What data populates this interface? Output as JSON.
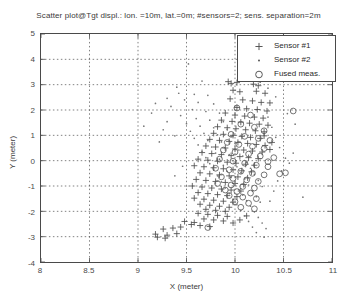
{
  "chart_data": {
    "type": "scatter",
    "title": "Scatter plot@Tgt displ.: lon. =10m, lat.=0m; #sensors=2; sens. separation=2m",
    "xlabel": "X (meter)",
    "ylabel": "Y (meter)",
    "xlim": [
      8,
      11
    ],
    "ylim": [
      -4,
      5
    ],
    "xticks": [
      8,
      8.5,
      9,
      9.5,
      10,
      10.5,
      11
    ],
    "xticklabels": [
      "8",
      "8.5",
      "9",
      "9.5",
      "10",
      "10.5",
      "11"
    ],
    "yticks": [
      -4,
      -3,
      -2,
      -1,
      0,
      1,
      2,
      3,
      4,
      5
    ],
    "yticklabels": [
      "-4",
      "-3",
      "-2",
      "-1",
      "0",
      "1",
      "2",
      "3",
      "4",
      "5"
    ],
    "grid": true,
    "grid_style": "dotted",
    "legend_position": "top-right",
    "marker_color": "#555555",
    "axis_color": "#4a4a4a",
    "background": "#ffffff",
    "series": [
      {
        "name": "Sensor #1",
        "marker": "plus",
        "color": "#4d4d4d",
        "points": [
          [
            9.93,
            3.12
          ],
          [
            9.96,
            3.05
          ],
          [
            10.02,
            3.08
          ],
          [
            10.19,
            3.02
          ],
          [
            10.24,
            2.96
          ],
          [
            9.98,
            2.78
          ],
          [
            10.05,
            2.72
          ],
          [
            10.22,
            2.74
          ],
          [
            10.31,
            2.66
          ],
          [
            9.95,
            2.44
          ],
          [
            10.08,
            2.4
          ],
          [
            10.18,
            2.36
          ],
          [
            10.27,
            2.3
          ],
          [
            10.36,
            2.28
          ],
          [
            10.02,
            2.1
          ],
          [
            10.12,
            2.05
          ],
          [
            10.23,
            2.02
          ],
          [
            10.33,
            1.96
          ],
          [
            9.9,
            1.88
          ],
          [
            10.0,
            1.8
          ],
          [
            10.1,
            1.76
          ],
          [
            10.2,
            1.72
          ],
          [
            10.29,
            1.68
          ],
          [
            9.86,
            1.6
          ],
          [
            9.97,
            1.55
          ],
          [
            10.06,
            1.52
          ],
          [
            10.15,
            1.48
          ],
          [
            10.25,
            1.44
          ],
          [
            10.34,
            1.4
          ],
          [
            9.82,
            1.34
          ],
          [
            9.92,
            1.3
          ],
          [
            10.01,
            1.26
          ],
          [
            10.11,
            1.22
          ],
          [
            10.21,
            1.18
          ],
          [
            10.3,
            1.14
          ],
          [
            9.78,
            1.08
          ],
          [
            9.88,
            1.04
          ],
          [
            9.98,
            1.0
          ],
          [
            10.07,
            0.96
          ],
          [
            10.16,
            0.92
          ],
          [
            10.26,
            0.88
          ],
          [
            9.74,
            0.84
          ],
          [
            9.84,
            0.8
          ],
          [
            9.94,
            0.76
          ],
          [
            10.03,
            0.72
          ],
          [
            10.13,
            0.68
          ],
          [
            10.22,
            0.64
          ],
          [
            10.31,
            0.6
          ],
          [
            9.7,
            0.58
          ],
          [
            9.8,
            0.54
          ],
          [
            9.9,
            0.5
          ],
          [
            10.0,
            0.46
          ],
          [
            10.09,
            0.42
          ],
          [
            10.18,
            0.38
          ],
          [
            10.28,
            0.34
          ],
          [
            9.66,
            0.32
          ],
          [
            9.76,
            0.28
          ],
          [
            9.86,
            0.24
          ],
          [
            9.96,
            0.2
          ],
          [
            10.05,
            0.16
          ],
          [
            10.14,
            0.12
          ],
          [
            10.24,
            0.08
          ],
          [
            9.62,
            0.06
          ],
          [
            9.72,
            0.02
          ],
          [
            9.82,
            -0.02
          ],
          [
            9.92,
            -0.06
          ],
          [
            10.01,
            -0.1
          ],
          [
            10.11,
            -0.14
          ],
          [
            10.2,
            -0.18
          ],
          [
            9.58,
            -0.2
          ],
          [
            9.68,
            -0.24
          ],
          [
            9.78,
            -0.28
          ],
          [
            9.88,
            -0.32
          ],
          [
            9.98,
            -0.36
          ],
          [
            10.07,
            -0.4
          ],
          [
            10.17,
            -0.44
          ],
          [
            9.64,
            -0.48
          ],
          [
            9.74,
            -0.52
          ],
          [
            9.84,
            -0.56
          ],
          [
            9.94,
            -0.6
          ],
          [
            10.03,
            -0.64
          ],
          [
            10.13,
            -0.68
          ],
          [
            9.6,
            -0.74
          ],
          [
            9.7,
            -0.78
          ],
          [
            9.8,
            -0.82
          ],
          [
            9.9,
            -0.86
          ],
          [
            10.0,
            -0.9
          ],
          [
            10.09,
            -0.94
          ],
          [
            9.56,
            -1.0
          ],
          [
            9.66,
            -1.04
          ],
          [
            9.76,
            -1.08
          ],
          [
            9.86,
            -1.12
          ],
          [
            9.96,
            -1.16
          ],
          [
            10.06,
            -1.2
          ],
          [
            9.62,
            -1.26
          ],
          [
            9.72,
            -1.3
          ],
          [
            9.82,
            -1.34
          ],
          [
            9.92,
            -1.38
          ],
          [
            10.02,
            -1.42
          ],
          [
            9.58,
            -1.48
          ],
          [
            9.68,
            -1.52
          ],
          [
            9.78,
            -1.56
          ],
          [
            9.88,
            -1.6
          ],
          [
            9.98,
            -1.64
          ],
          [
            9.64,
            -1.72
          ],
          [
            9.74,
            -1.76
          ],
          [
            9.84,
            -1.8
          ],
          [
            9.94,
            -1.84
          ],
          [
            9.7,
            -1.92
          ],
          [
            9.8,
            -1.96
          ],
          [
            9.9,
            -2.0
          ],
          [
            9.62,
            -2.08
          ],
          [
            9.72,
            -2.12
          ],
          [
            9.82,
            -2.16
          ],
          [
            9.92,
            -2.2
          ],
          [
            9.68,
            -2.3
          ],
          [
            9.78,
            -2.34
          ],
          [
            9.88,
            -2.38
          ],
          [
            9.55,
            -2.52
          ],
          [
            9.64,
            -2.56
          ],
          [
            9.74,
            -2.6
          ],
          [
            9.44,
            -2.62
          ],
          [
            9.36,
            -2.66
          ],
          [
            9.26,
            -2.7
          ],
          [
            9.18,
            -2.9
          ],
          [
            9.3,
            -2.94
          ],
          [
            9.4,
            -2.88
          ],
          [
            9.48,
            -2.4
          ],
          [
            9.58,
            -2.44
          ],
          [
            9.2,
            -3.02
          ],
          [
            9.28,
            -3.06
          ],
          [
            10.12,
            -2.18
          ],
          [
            10.05,
            -2.34
          ],
          [
            9.98,
            -2.46
          ],
          [
            10.3,
            0.98
          ],
          [
            10.38,
            0.72
          ],
          [
            10.36,
            0.44
          ]
        ]
      },
      {
        "name": "Sensor #2",
        "marker": "dot",
        "color": "#777777",
        "points": [
          [
            9.52,
            3.82
          ],
          [
            9.66,
            3.14
          ],
          [
            9.4,
            2.9
          ],
          [
            9.58,
            2.62
          ],
          [
            9.72,
            2.58
          ],
          [
            9.48,
            2.4
          ],
          [
            9.62,
            2.3
          ],
          [
            9.78,
            2.24
          ],
          [
            9.34,
            2.14
          ],
          [
            9.56,
            2.02
          ],
          [
            9.7,
            1.94
          ],
          [
            9.84,
            1.88
          ],
          [
            9.44,
            1.78
          ],
          [
            9.6,
            1.66
          ],
          [
            9.74,
            1.6
          ],
          [
            9.88,
            1.54
          ],
          [
            9.5,
            1.46
          ],
          [
            9.64,
            1.36
          ],
          [
            9.78,
            1.3
          ],
          [
            9.92,
            1.24
          ],
          [
            9.54,
            1.16
          ],
          [
            9.68,
            1.08
          ],
          [
            9.82,
            1.02
          ],
          [
            9.96,
            0.96
          ],
          [
            9.58,
            0.88
          ],
          [
            9.72,
            0.8
          ],
          [
            9.86,
            0.74
          ],
          [
            10.0,
            0.68
          ],
          [
            9.62,
            0.62
          ],
          [
            9.76,
            0.54
          ],
          [
            9.9,
            0.48
          ],
          [
            10.04,
            0.42
          ],
          [
            9.66,
            0.36
          ],
          [
            9.8,
            0.3
          ],
          [
            9.94,
            0.24
          ],
          [
            10.08,
            0.18
          ],
          [
            9.7,
            0.12
          ],
          [
            9.84,
            0.06
          ],
          [
            9.98,
            0.0
          ],
          [
            10.12,
            -0.06
          ],
          [
            9.74,
            -0.12
          ],
          [
            9.88,
            -0.18
          ],
          [
            10.02,
            -0.24
          ],
          [
            10.16,
            -0.3
          ],
          [
            9.78,
            -0.36
          ],
          [
            9.92,
            -0.42
          ],
          [
            10.06,
            -0.48
          ],
          [
            10.2,
            -0.54
          ],
          [
            9.82,
            -0.6
          ],
          [
            9.96,
            -0.66
          ],
          [
            10.1,
            -0.72
          ],
          [
            10.24,
            -0.78
          ],
          [
            9.86,
            -0.84
          ],
          [
            10.0,
            -0.9
          ],
          [
            10.14,
            -0.96
          ],
          [
            10.28,
            -1.02
          ],
          [
            9.9,
            -1.08
          ],
          [
            10.04,
            -1.14
          ],
          [
            10.18,
            -1.2
          ],
          [
            9.94,
            -1.3
          ],
          [
            10.08,
            -1.36
          ],
          [
            10.22,
            -1.42
          ],
          [
            9.98,
            -1.52
          ],
          [
            10.12,
            -1.58
          ],
          [
            10.26,
            -1.64
          ],
          [
            10.02,
            -1.74
          ],
          [
            10.16,
            -1.8
          ],
          [
            10.06,
            -1.96
          ],
          [
            10.2,
            -2.02
          ],
          [
            10.1,
            -2.18
          ],
          [
            10.24,
            -2.24
          ],
          [
            10.14,
            -2.4
          ],
          [
            10.28,
            -2.46
          ],
          [
            10.18,
            -2.62
          ],
          [
            10.32,
            -2.68
          ],
          [
            10.22,
            -2.84
          ],
          [
            10.3,
            -3.02
          ],
          [
            10.36,
            -1.6
          ],
          [
            10.4,
            -1.2
          ],
          [
            10.44,
            -0.8
          ],
          [
            10.48,
            -0.4
          ],
          [
            10.52,
            0.1
          ],
          [
            10.46,
            0.52
          ],
          [
            10.42,
            0.92
          ],
          [
            10.38,
            1.32
          ],
          [
            10.34,
            1.72
          ],
          [
            10.56,
            -0.1
          ],
          [
            10.6,
            0.3
          ],
          [
            9.3,
            1.54
          ],
          [
            9.26,
            1.22
          ],
          [
            9.38,
            0.98
          ],
          [
            9.22,
            0.74
          ],
          [
            9.42,
            2.66
          ],
          [
            9.3,
            2.46
          ],
          [
            9.18,
            2.26
          ],
          [
            10.26,
            3.1
          ],
          [
            10.34,
            2.86
          ],
          [
            10.42,
            2.52
          ],
          [
            9.46,
            -0.22
          ],
          [
            9.38,
            -0.6
          ],
          [
            9.5,
            -1.0
          ],
          [
            10.62,
            1.44
          ],
          [
            10.54,
            1.86
          ],
          [
            10.7,
            -1.44
          ],
          [
            9.14,
            1.88
          ],
          [
            9.06,
            1.36
          ]
        ]
      },
      {
        "name": "Fused meas.",
        "marker": "circle",
        "color": "#5a5a5a",
        "points": [
          [
            10.02,
            2.08
          ],
          [
            10.16,
            1.8
          ],
          [
            10.06,
            1.44
          ],
          [
            10.2,
            1.32
          ],
          [
            10.3,
            1.18
          ],
          [
            9.96,
            1.04
          ],
          [
            10.1,
            0.96
          ],
          [
            10.24,
            0.88
          ],
          [
            10.36,
            0.8
          ],
          [
            9.92,
            0.72
          ],
          [
            10.04,
            0.64
          ],
          [
            10.18,
            0.56
          ],
          [
            10.3,
            0.48
          ],
          [
            9.88,
            0.42
          ],
          [
            10.0,
            0.34
          ],
          [
            10.14,
            0.26
          ],
          [
            10.26,
            0.18
          ],
          [
            10.4,
            0.12
          ],
          [
            9.84,
            0.06
          ],
          [
            9.98,
            -0.02
          ],
          [
            10.1,
            -0.1
          ],
          [
            10.22,
            -0.18
          ],
          [
            10.34,
            -0.24
          ],
          [
            9.8,
            -0.3
          ],
          [
            9.94,
            -0.36
          ],
          [
            10.06,
            -0.42
          ],
          [
            10.18,
            -0.5
          ],
          [
            10.3,
            -0.56
          ],
          [
            9.86,
            -0.64
          ],
          [
            9.98,
            -0.7
          ],
          [
            10.12,
            -0.76
          ],
          [
            10.24,
            -0.82
          ],
          [
            9.82,
            -0.9
          ],
          [
            9.96,
            -0.96
          ],
          [
            10.08,
            -1.02
          ],
          [
            10.2,
            -1.08
          ],
          [
            9.9,
            -1.16
          ],
          [
            10.02,
            -1.22
          ],
          [
            10.16,
            -1.28
          ],
          [
            9.94,
            -1.38
          ],
          [
            10.08,
            -1.44
          ],
          [
            10.22,
            -1.5
          ],
          [
            10.0,
            -1.62
          ],
          [
            10.14,
            -1.68
          ],
          [
            10.06,
            -1.84
          ],
          [
            10.2,
            -1.9
          ],
          [
            9.72,
            -2.64
          ],
          [
            10.52,
            -0.48
          ],
          [
            10.46,
            -0.52
          ],
          [
            10.6,
            1.96
          ],
          [
            10.34,
            -0.04
          ]
        ]
      }
    ]
  },
  "legend": {
    "items": [
      {
        "label": "Sensor #1",
        "marker": "plus"
      },
      {
        "label": "Sensor #2",
        "marker": "dot"
      },
      {
        "label": "Fused meas.",
        "marker": "circle"
      }
    ]
  }
}
